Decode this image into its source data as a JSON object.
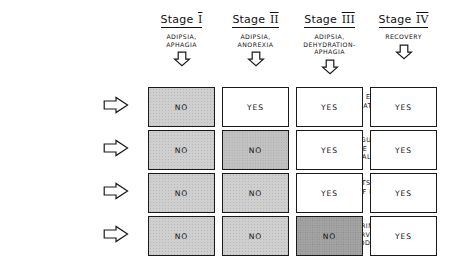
{
  "figure": {
    "columns": [
      {
        "id": "stage-1",
        "label": "Stage",
        "numeral": "I",
        "symptoms": "ADIPSIA,\nAPHAGIA",
        "arrow": "down-arrow-icon"
      },
      {
        "id": "stage-2",
        "label": "Stage",
        "numeral": "II",
        "symptoms": "ADIPSIA,\nANOREXIA",
        "arrow": "down-arrow-icon"
      },
      {
        "id": "stage-3",
        "label": "Stage",
        "numeral": "III",
        "symptoms": "ADIPSIA,\nDEHYDRATION-\nAPHAGIA",
        "arrow": "down-arrow-icon"
      },
      {
        "id": "stage-4",
        "label": "Stage",
        "numeral": "IV",
        "symptoms": "RECOVERY",
        "arrow": "down-arrow-icon"
      }
    ],
    "rows": [
      {
        "id": "eats-wet-palatable-foods",
        "label": "EATS WET\nPALATABLE FOODS",
        "arrow": "right-arrow-icon"
      },
      {
        "id": "regulates-food-intake",
        "label": "REGULATES FOOD\nINTAKE & BODY WT. ON\nWET PALATABLE FOODS.",
        "arrow": "right-arrow-icon"
      },
      {
        "id": "eats-dry-foods",
        "label": "EATS DRY FOODS\n(IF HYDRATED)",
        "arrow": "right-arrow-icon"
      },
      {
        "id": "drinks-water",
        "label": "DRINKS WATER,\nSURVIVES ON DRY\nFOOD AND WATER.",
        "arrow": "right-arrow-icon"
      }
    ],
    "cells": [
      [
        {
          "value": "NO",
          "shade": "light"
        },
        {
          "value": "YES",
          "shade": "none"
        },
        {
          "value": "YES",
          "shade": "none"
        },
        {
          "value": "YES",
          "shade": "none"
        }
      ],
      [
        {
          "value": "NO",
          "shade": "light"
        },
        {
          "value": "NO",
          "shade": "medium"
        },
        {
          "value": "YES",
          "shade": "none"
        },
        {
          "value": "YES",
          "shade": "none"
        }
      ],
      [
        {
          "value": "NO",
          "shade": "light"
        },
        {
          "value": "NO",
          "shade": "light"
        },
        {
          "value": "YES",
          "shade": "none"
        },
        {
          "value": "YES",
          "shade": "none"
        }
      ],
      [
        {
          "value": "NO",
          "shade": "light"
        },
        {
          "value": "NO",
          "shade": "light"
        },
        {
          "value": "NO",
          "shade": "dark"
        },
        {
          "value": "YES",
          "shade": "none"
        }
      ]
    ],
    "colors": {
      "ink": "#121212",
      "paper": "#ffffff",
      "shade_light": "#cfcfcf",
      "shade_medium": "#c2c2c2",
      "shade_dark": "#a3a3a3"
    }
  }
}
